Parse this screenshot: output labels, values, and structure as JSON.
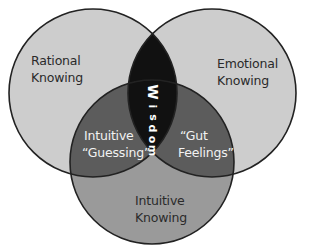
{
  "diagram": {
    "type": "venn-3",
    "colors": {
      "outer_circle_fill": "#cdcdcd",
      "bottom_circle_fill": "#9a9a9a",
      "pair_overlap_fill": "#5c5c5c",
      "center_overlap_fill": "#111111",
      "stroke": "#222222",
      "background": "#ffffff"
    },
    "circles": [
      {
        "id": "rational",
        "label_line1": "Rational",
        "label_line2": "Knowing"
      },
      {
        "id": "emotional",
        "label_line1": "Emotional",
        "label_line2": "Knowing"
      },
      {
        "id": "intuitive",
        "label_line1": "Intuitive",
        "label_line2": "Knowing"
      }
    ],
    "overlaps": {
      "rational_intuitive": {
        "line1": "Intuitive",
        "line2": "“Guessing”"
      },
      "emotional_intuitive": {
        "line1": "“Gut",
        "line2": "Feelings”"
      },
      "center": {
        "label": "Wisdom",
        "letters": [
          "W",
          "i",
          "s",
          "d",
          "o",
          "m"
        ]
      }
    }
  }
}
